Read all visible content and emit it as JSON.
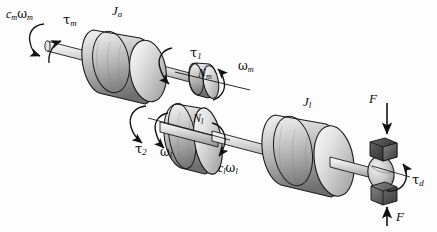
{
  "figure": {
    "type": "mechanical-schematic",
    "background_color": "#fdfdfd",
    "ink_color": "#111111"
  },
  "labels": {
    "motor_damping": {
      "text": "c",
      "sub": "m",
      "text2": "ω",
      "sub2": "m",
      "name": "motor-damping-torque"
    },
    "motor_torque": {
      "text": "τ",
      "sub": "m",
      "name": "motor-torque"
    },
    "motor_inertia": {
      "text": "J",
      "sub": "a",
      "name": "armature-inertia"
    },
    "gear_torque_1": {
      "text": "τ",
      "sub": "1",
      "name": "gear-torque-1"
    },
    "motor_gear": {
      "text": "N",
      "sub": "m",
      "name": "motor-gear-teeth"
    },
    "motor_speed": {
      "text": "ω",
      "sub": "m",
      "name": "motor-angular-velocity"
    },
    "load_gear": {
      "text": "N",
      "sub": "l",
      "name": "load-gear-teeth"
    },
    "gear_torque_2": {
      "text": "τ",
      "sub": "2",
      "name": "gear-torque-2"
    },
    "load_speed": {
      "text": "ω",
      "sub": "l",
      "name": "load-angular-velocity"
    },
    "load_damping": {
      "text": "c",
      "sub": "l",
      "text2": "ω",
      "sub2": "l",
      "name": "load-damping-torque"
    },
    "load_inertia": {
      "text": "J",
      "sub": "l",
      "name": "load-inertia"
    },
    "force_top": {
      "text": "F",
      "name": "brake-force-top"
    },
    "force_bottom": {
      "text": "F",
      "name": "brake-force-bottom"
    },
    "disturbance_torque": {
      "text": "τ",
      "sub": "d",
      "name": "disturbance-torque"
    }
  },
  "components": {
    "motor_shaft": "motor-shaft",
    "load_shaft": "load-shaft",
    "rotor_disk": "armature-inertia-disk",
    "pinion": "motor-pinion-gear",
    "gear": "load-gear",
    "load_disk": "load-inertia-disk",
    "brake_pad_top": "brake-pad-top",
    "brake_pad_bottom": "brake-pad-bottom",
    "brake_drum": "brake-drum"
  }
}
